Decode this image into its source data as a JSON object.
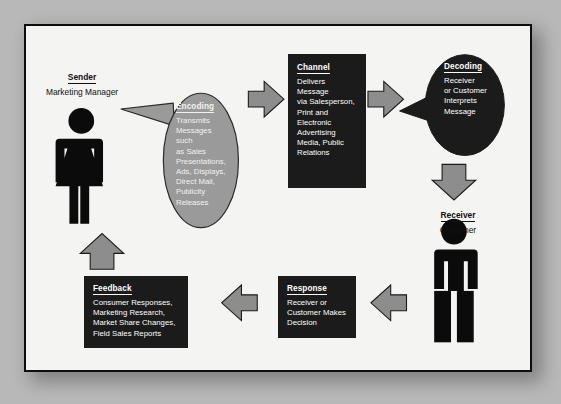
{
  "diagram": {
    "colors": {
      "page_background": "#b8b8b8",
      "card_background": "#f4f4f2",
      "card_border": "#0d0d0d",
      "dark_fill": "#1b1b1b",
      "gray_fill": "#9a9a9a",
      "arrow_fill": "#8d8d8d",
      "arrow_stroke": "#1a1a1a",
      "figure_fill": "#0b0b0b"
    },
    "sender": {
      "role": "Sender",
      "subtitle": "Marketing Manager",
      "icon": "female-person-icon"
    },
    "receiver": {
      "role": "Receiver",
      "subtitle": "Customer",
      "icon": "male-person-icon"
    },
    "nodes": [
      {
        "id": "encoding",
        "title": "Encoding",
        "body": "Transmits\nMessages\nsuch\nas Sales\nPresentations,\nAds, Displays,\nDirect Mail,\nPublicity\nReleases",
        "shape": "speech-bubble-oval",
        "fill": "#9a9a9a",
        "text_color": "#f2f2f2"
      },
      {
        "id": "channel",
        "title": "Channel",
        "body": "Delivers\nMessage\nvia Salesperson,\nPrint and\nElectronic\nAdvertising\nMedia, Public\nRelations",
        "shape": "rectangle",
        "fill": "#1b1b1b",
        "text_color": "#ffffff"
      },
      {
        "id": "decoding",
        "title": "Decoding",
        "body": "Receiver\nor Customer\nInterprets\nMessage",
        "shape": "speech-bubble-oval",
        "fill": "#1b1b1b",
        "text_color": "#ffffff"
      },
      {
        "id": "response",
        "title": "Response",
        "body": "Receiver or\nCustomer Makes\nDecision",
        "shape": "rectangle",
        "fill": "#1b1b1b",
        "text_color": "#ffffff"
      },
      {
        "id": "feedback",
        "title": "Feedback",
        "body": "Consumer Responses,\nMarketing Research,\nMarket Share Changes,\nField Sales Reports",
        "shape": "rectangle",
        "fill": "#1b1b1b",
        "text_color": "#ffffff"
      }
    ],
    "arrows": [
      {
        "id": "encoding-to-channel",
        "direction": "right"
      },
      {
        "id": "channel-to-decoding",
        "direction": "right"
      },
      {
        "id": "decoding-to-receiver",
        "direction": "down"
      },
      {
        "id": "receiver-to-response",
        "direction": "left"
      },
      {
        "id": "response-to-feedback",
        "direction": "left"
      },
      {
        "id": "feedback-to-sender",
        "direction": "up"
      }
    ]
  }
}
